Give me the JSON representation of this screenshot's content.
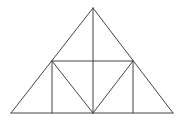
{
  "diagram": {
    "stroke_color": "#444444",
    "background": "#ffffff",
    "points": {
      "apex": [
        93,
        8
      ],
      "left_mid": [
        52,
        61
      ],
      "right_mid": [
        133,
        61
      ],
      "base_left": [
        11,
        113
      ],
      "base_right": [
        173,
        113
      ],
      "base_center": [
        93,
        113
      ],
      "base_left_foot": [
        52,
        113
      ],
      "base_right_foot": [
        133,
        113
      ],
      "mid_center": [
        93,
        61
      ]
    },
    "segments": [
      {
        "name": "left-side",
        "from": "base_left",
        "to": "apex"
      },
      {
        "name": "right-side",
        "from": "apex",
        "to": "base_right"
      },
      {
        "name": "base",
        "from": "base_left",
        "to": "base_right"
      },
      {
        "name": "midline",
        "from": "left_mid",
        "to": "right_mid"
      },
      {
        "name": "center-vertical",
        "from": "apex",
        "to": "base_center"
      },
      {
        "name": "left-vertical",
        "from": "left_mid",
        "to": "base_left_foot"
      },
      {
        "name": "right-vertical",
        "from": "right_mid",
        "to": "base_right_foot"
      },
      {
        "name": "left-inner-diagonal",
        "from": "left_mid",
        "to": "base_center"
      },
      {
        "name": "right-inner-diagonal",
        "from": "right_mid",
        "to": "base_center"
      }
    ]
  }
}
